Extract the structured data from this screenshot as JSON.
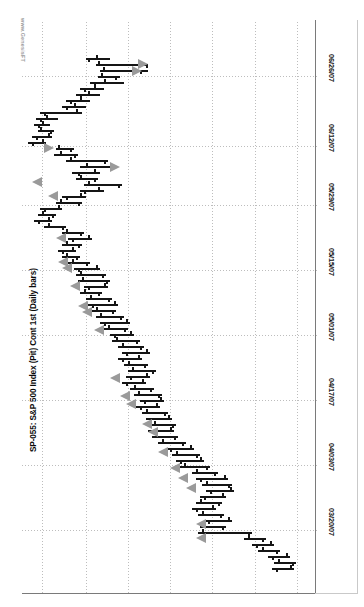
{
  "chart_data": {
    "type": "bar",
    "subtype": "ohlc-daily-bars",
    "orientation": "rotated-90",
    "title": "SP-055: S&P 500 Index (Pit) Cont 1st (Daily bars)",
    "watermark": "www.GenesisFT",
    "xlabel": "",
    "ylabel": "",
    "grid": true,
    "legend": "none",
    "date_axis": {
      "position": "right",
      "tick_labels": [
        "06/26/07",
        "06/12/07",
        "05/29/07",
        "05/15/07",
        "05/01/07",
        "04/17/07",
        "04/03/07",
        "03/20/07"
      ],
      "tick_pixels": [
        76,
        146,
        205,
        270,
        335,
        400,
        465,
        530
      ]
    },
    "price_axis": {
      "position": "top-implicit",
      "gridline_pixels": [
        42,
        86,
        128,
        170,
        212,
        255,
        297
      ],
      "labels_visible": false
    },
    "colors": {
      "bar": "#151515",
      "signal": "#9a9a9a",
      "grid": "#bdbdbd",
      "axis": "#7a7a7a",
      "background": "#ffffff",
      "title": "#0b0b0b",
      "watermark": "#9b9b9b"
    },
    "bars": [
      {
        "t": 58,
        "lo": 86,
        "hi": 110,
        "op": 96,
        "cl": 88
      },
      {
        "t": 64,
        "lo": 96,
        "hi": 148,
        "op": 98,
        "cl": 146
      },
      {
        "t": 70,
        "lo": 100,
        "hi": 148,
        "op": 103,
        "cl": 140
      },
      {
        "t": 76,
        "lo": 98,
        "hi": 120,
        "op": 101,
        "cl": 115
      },
      {
        "t": 82,
        "lo": 90,
        "hi": 124,
        "op": 104,
        "cl": 94
      },
      {
        "t": 88,
        "lo": 80,
        "hi": 104,
        "op": 94,
        "cl": 84
      },
      {
        "t": 94,
        "lo": 76,
        "hi": 100,
        "op": 88,
        "cl": 80
      },
      {
        "t": 100,
        "lo": 66,
        "hi": 90,
        "op": 80,
        "cl": 70
      },
      {
        "t": 106,
        "lo": 62,
        "hi": 86,
        "op": 74,
        "cl": 66
      },
      {
        "t": 112,
        "lo": 40,
        "hi": 82,
        "op": 76,
        "cl": 44
      },
      {
        "t": 118,
        "lo": 36,
        "hi": 58,
        "op": 46,
        "cl": 40
      },
      {
        "t": 124,
        "lo": 34,
        "hi": 50,
        "op": 42,
        "cl": 38
      },
      {
        "t": 130,
        "lo": 38,
        "hi": 54,
        "op": 40,
        "cl": 50
      },
      {
        "t": 136,
        "lo": 32,
        "hi": 52,
        "op": 48,
        "cl": 36
      },
      {
        "t": 142,
        "lo": 28,
        "hi": 46,
        "op": 42,
        "cl": 32
      },
      {
        "t": 148,
        "lo": 56,
        "hi": 74,
        "op": 58,
        "cl": 70
      },
      {
        "t": 154,
        "lo": 54,
        "hi": 78,
        "op": 60,
        "cl": 74
      },
      {
        "t": 160,
        "lo": 66,
        "hi": 108,
        "op": 70,
        "cl": 104
      },
      {
        "t": 166,
        "lo": 80,
        "hi": 116,
        "op": 86,
        "cl": 112
      },
      {
        "t": 172,
        "lo": 72,
        "hi": 100,
        "op": 94,
        "cl": 78
      },
      {
        "t": 178,
        "lo": 76,
        "hi": 98,
        "op": 80,
        "cl": 94
      },
      {
        "t": 184,
        "lo": 84,
        "hi": 122,
        "op": 88,
        "cl": 118
      },
      {
        "t": 190,
        "lo": 80,
        "hi": 104,
        "op": 98,
        "cl": 84
      },
      {
        "t": 196,
        "lo": 62,
        "hi": 86,
        "op": 80,
        "cl": 66
      },
      {
        "t": 202,
        "lo": 56,
        "hi": 82,
        "op": 60,
        "cl": 78
      },
      {
        "t": 208,
        "lo": 40,
        "hi": 62,
        "op": 58,
        "cl": 44
      },
      {
        "t": 214,
        "lo": 38,
        "hi": 56,
        "op": 42,
        "cl": 52
      },
      {
        "t": 220,
        "lo": 34,
        "hi": 52,
        "op": 48,
        "cl": 38
      },
      {
        "t": 226,
        "lo": 44,
        "hi": 66,
        "op": 48,
        "cl": 62
      },
      {
        "t": 232,
        "lo": 62,
        "hi": 84,
        "op": 66,
        "cl": 80
      },
      {
        "t": 238,
        "lo": 68,
        "hi": 92,
        "op": 88,
        "cl": 72
      },
      {
        "t": 244,
        "lo": 62,
        "hi": 82,
        "op": 66,
        "cl": 78
      },
      {
        "t": 250,
        "lo": 58,
        "hi": 76,
        "op": 72,
        "cl": 62
      },
      {
        "t": 256,
        "lo": 62,
        "hi": 80,
        "op": 66,
        "cl": 76
      },
      {
        "t": 262,
        "lo": 68,
        "hi": 90,
        "op": 72,
        "cl": 86
      },
      {
        "t": 268,
        "lo": 74,
        "hi": 100,
        "op": 96,
        "cl": 78
      },
      {
        "t": 274,
        "lo": 76,
        "hi": 106,
        "op": 80,
        "cl": 102
      },
      {
        "t": 280,
        "lo": 78,
        "hi": 110,
        "op": 82,
        "cl": 106
      },
      {
        "t": 286,
        "lo": 84,
        "hi": 108,
        "op": 104,
        "cl": 88
      },
      {
        "t": 292,
        "lo": 80,
        "hi": 102,
        "op": 84,
        "cl": 98
      },
      {
        "t": 298,
        "lo": 86,
        "hi": 112,
        "op": 90,
        "cl": 108
      },
      {
        "t": 304,
        "lo": 88,
        "hi": 118,
        "op": 114,
        "cl": 92
      },
      {
        "t": 310,
        "lo": 92,
        "hi": 116,
        "op": 96,
        "cl": 112
      },
      {
        "t": 316,
        "lo": 96,
        "hi": 124,
        "op": 100,
        "cl": 120
      },
      {
        "t": 322,
        "lo": 100,
        "hi": 130,
        "op": 126,
        "cl": 104
      },
      {
        "t": 328,
        "lo": 104,
        "hi": 128,
        "op": 108,
        "cl": 124
      },
      {
        "t": 334,
        "lo": 110,
        "hi": 134,
        "op": 130,
        "cl": 114
      },
      {
        "t": 340,
        "lo": 112,
        "hi": 140,
        "op": 116,
        "cl": 136
      },
      {
        "t": 346,
        "lo": 118,
        "hi": 144,
        "op": 122,
        "cl": 140
      },
      {
        "t": 352,
        "lo": 122,
        "hi": 150,
        "op": 146,
        "cl": 126
      },
      {
        "t": 358,
        "lo": 118,
        "hi": 142,
        "op": 138,
        "cl": 122
      },
      {
        "t": 364,
        "lo": 124,
        "hi": 148,
        "op": 128,
        "cl": 144
      },
      {
        "t": 370,
        "lo": 128,
        "hi": 156,
        "op": 132,
        "cl": 152
      },
      {
        "t": 376,
        "lo": 126,
        "hi": 150,
        "op": 146,
        "cl": 130
      },
      {
        "t": 382,
        "lo": 122,
        "hi": 146,
        "op": 142,
        "cl": 126
      },
      {
        "t": 388,
        "lo": 130,
        "hi": 154,
        "op": 134,
        "cl": 150
      },
      {
        "t": 394,
        "lo": 134,
        "hi": 162,
        "op": 138,
        "cl": 158
      },
      {
        "t": 400,
        "lo": 140,
        "hi": 164,
        "op": 160,
        "cl": 144
      },
      {
        "t": 406,
        "lo": 136,
        "hi": 160,
        "op": 156,
        "cl": 140
      },
      {
        "t": 412,
        "lo": 142,
        "hi": 168,
        "op": 146,
        "cl": 164
      },
      {
        "t": 418,
        "lo": 146,
        "hi": 172,
        "op": 168,
        "cl": 150
      },
      {
        "t": 424,
        "lo": 150,
        "hi": 176,
        "op": 154,
        "cl": 172
      },
      {
        "t": 430,
        "lo": 148,
        "hi": 174,
        "op": 170,
        "cl": 152
      },
      {
        "t": 436,
        "lo": 152,
        "hi": 178,
        "op": 156,
        "cl": 174
      },
      {
        "t": 442,
        "lo": 158,
        "hi": 186,
        "op": 162,
        "cl": 182
      },
      {
        "t": 448,
        "lo": 166,
        "hi": 194,
        "op": 190,
        "cl": 170
      },
      {
        "t": 454,
        "lo": 172,
        "hi": 200,
        "op": 176,
        "cl": 196
      },
      {
        "t": 460,
        "lo": 176,
        "hi": 204,
        "op": 200,
        "cl": 180
      },
      {
        "t": 466,
        "lo": 180,
        "hi": 210,
        "op": 184,
        "cl": 206
      },
      {
        "t": 472,
        "lo": 192,
        "hi": 218,
        "op": 196,
        "cl": 214
      },
      {
        "t": 478,
        "lo": 196,
        "hi": 228,
        "op": 224,
        "cl": 200
      },
      {
        "t": 484,
        "lo": 202,
        "hi": 232,
        "op": 206,
        "cl": 228
      },
      {
        "t": 490,
        "lo": 206,
        "hi": 234,
        "op": 230,
        "cl": 210
      },
      {
        "t": 496,
        "lo": 200,
        "hi": 226,
        "op": 222,
        "cl": 204
      },
      {
        "t": 502,
        "lo": 196,
        "hi": 222,
        "op": 200,
        "cl": 218
      },
      {
        "t": 508,
        "lo": 192,
        "hi": 216,
        "op": 212,
        "cl": 196
      },
      {
        "t": 514,
        "lo": 198,
        "hi": 224,
        "op": 202,
        "cl": 220
      },
      {
        "t": 520,
        "lo": 204,
        "hi": 232,
        "op": 228,
        "cl": 208
      },
      {
        "t": 526,
        "lo": 200,
        "hi": 226,
        "op": 204,
        "cl": 222
      },
      {
        "t": 532,
        "lo": 198,
        "hi": 252,
        "op": 202,
        "cl": 248
      },
      {
        "t": 538,
        "lo": 244,
        "hi": 266,
        "op": 248,
        "cl": 262
      },
      {
        "t": 544,
        "lo": 252,
        "hi": 274,
        "op": 270,
        "cl": 256
      },
      {
        "t": 550,
        "lo": 258,
        "hi": 280,
        "op": 262,
        "cl": 276
      },
      {
        "t": 556,
        "lo": 268,
        "hi": 290,
        "op": 286,
        "cl": 272
      },
      {
        "t": 562,
        "lo": 274,
        "hi": 296,
        "op": 278,
        "cl": 292
      },
      {
        "t": 568,
        "lo": 272,
        "hi": 294,
        "op": 290,
        "cl": 276
      }
    ],
    "signals": [
      {
        "t": 64,
        "x": 138,
        "dir": "right"
      },
      {
        "t": 71,
        "x": 132,
        "dir": "right"
      },
      {
        "t": 148,
        "x": 44,
        "dir": "right"
      },
      {
        "t": 167,
        "x": 110,
        "dir": "right"
      },
      {
        "t": 182,
        "x": 32,
        "dir": "left"
      },
      {
        "t": 196,
        "x": 48,
        "dir": "left"
      },
      {
        "t": 238,
        "x": 56,
        "dir": "left"
      },
      {
        "t": 262,
        "x": 58,
        "dir": "left"
      },
      {
        "t": 268,
        "x": 62,
        "dir": "left"
      },
      {
        "t": 286,
        "x": 70,
        "dir": "left"
      },
      {
        "t": 306,
        "x": 78,
        "dir": "left"
      },
      {
        "t": 312,
        "x": 82,
        "dir": "left"
      },
      {
        "t": 330,
        "x": 94,
        "dir": "left"
      },
      {
        "t": 378,
        "x": 110,
        "dir": "left"
      },
      {
        "t": 396,
        "x": 120,
        "dir": "left"
      },
      {
        "t": 404,
        "x": 126,
        "dir": "left"
      },
      {
        "t": 424,
        "x": 142,
        "dir": "left"
      },
      {
        "t": 432,
        "x": 148,
        "dir": "left"
      },
      {
        "t": 452,
        "x": 158,
        "dir": "left"
      },
      {
        "t": 468,
        "x": 170,
        "dir": "left"
      },
      {
        "t": 478,
        "x": 178,
        "dir": "left"
      },
      {
        "t": 488,
        "x": 186,
        "dir": "left"
      },
      {
        "t": 524,
        "x": 196,
        "dir": "left"
      },
      {
        "t": 538,
        "x": 196,
        "dir": "left"
      }
    ]
  }
}
